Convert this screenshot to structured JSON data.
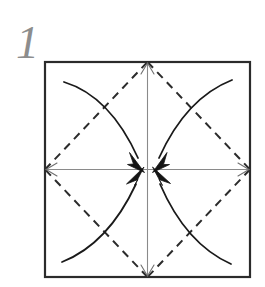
{
  "figure": {
    "kind": "origami-fold-diagram",
    "step_number": "1",
    "background_color": "#ffffff",
    "caption": ""
  },
  "colors": {
    "paper_outline": "#2b2b2b",
    "crease_dashed": "#2b2b2b",
    "center_axis": "#8a8a8a",
    "motion_arrow": "#1a1a1a",
    "step_number": "#8d8d8d",
    "paper_fill": "#ffffff"
  },
  "paper": {
    "label": "square-sheet",
    "left": 45,
    "top": 62,
    "right": 250,
    "bottom": 277,
    "stroke_width": 2.2
  },
  "center_point": {
    "label": "center",
    "x": 147.5,
    "y": 169.5
  },
  "edge_midpoints": {
    "top": {
      "x": 147.5,
      "y": 62
    },
    "right": {
      "x": 250,
      "y": 169.5
    },
    "bottom": {
      "x": 147.5,
      "y": 277
    },
    "left": {
      "x": 45,
      "y": 169.5
    }
  },
  "corners": {
    "top_left": {
      "x": 45,
      "y": 62
    },
    "top_right": {
      "x": 250,
      "y": 62
    },
    "bottom_right": {
      "x": 250,
      "y": 277
    },
    "bottom_left": {
      "x": 45,
      "y": 277
    }
  },
  "creases": {
    "style": "dashed",
    "dash_pattern": "8 6",
    "stroke_width": 2.0,
    "description": "valley-fold diamond connecting the four edge midpoints",
    "segments": [
      {
        "name": "crease-top-to-right",
        "x1": 147.5,
        "y1": 62,
        "x2": 250,
        "y2": 169.5
      },
      {
        "name": "crease-right-to-bottom",
        "x1": 250,
        "y1": 169.5,
        "x2": 147.5,
        "y2": 277
      },
      {
        "name": "crease-bottom-to-left",
        "x1": 147.5,
        "y1": 277,
        "x2": 45,
        "y2": 169.5
      },
      {
        "name": "crease-left-to-top",
        "x1": 45,
        "y1": 169.5,
        "x2": 147.5,
        "y2": 62
      }
    ]
  },
  "axes": {
    "style": "solid-thin-double-arrow",
    "stroke_width": 1.1,
    "segments": [
      {
        "name": "axis-vertical",
        "x1": 147.5,
        "y1": 62,
        "x2": 147.5,
        "y2": 277
      },
      {
        "name": "axis-horizontal",
        "x1": 45,
        "y1": 169.5,
        "x2": 250,
        "y2": 169.5
      }
    ]
  },
  "motion_arrows": {
    "count": 4,
    "stroke_width": 1.8,
    "arrowhead": "solid-filled-triangle",
    "description": "four curved arrows bringing each corner region in to the center",
    "items": [
      {
        "name": "arrow-top-left-to-center",
        "from_corner": "top_left",
        "path": "M 64 82 Q 110 96 140 160",
        "head_tip": {
          "x": 144,
          "y": 172
        },
        "head_angle_deg": 72
      },
      {
        "name": "arrow-top-right-to-center",
        "from_corner": "top_right",
        "path": "M 232 80 Q 186 98 158 160",
        "head_tip": {
          "x": 153,
          "y": 172
        },
        "head_angle_deg": 108
      },
      {
        "name": "arrow-bottom-left-to-center",
        "from_corner": "bottom_left",
        "path": "M 62 262 Q 108 244 138 182",
        "head_tip": {
          "x": 143,
          "y": 170
        },
        "head_angle_deg": -72
      },
      {
        "name": "arrow-bottom-right-to-center",
        "from_corner": "bottom_right",
        "path": "M 231 264 Q 186 244 158 182",
        "head_tip": {
          "x": 153,
          "y": 170
        },
        "head_angle_deg": -108
      }
    ]
  },
  "step_number_position": {
    "x": 16,
    "y": 58
  }
}
